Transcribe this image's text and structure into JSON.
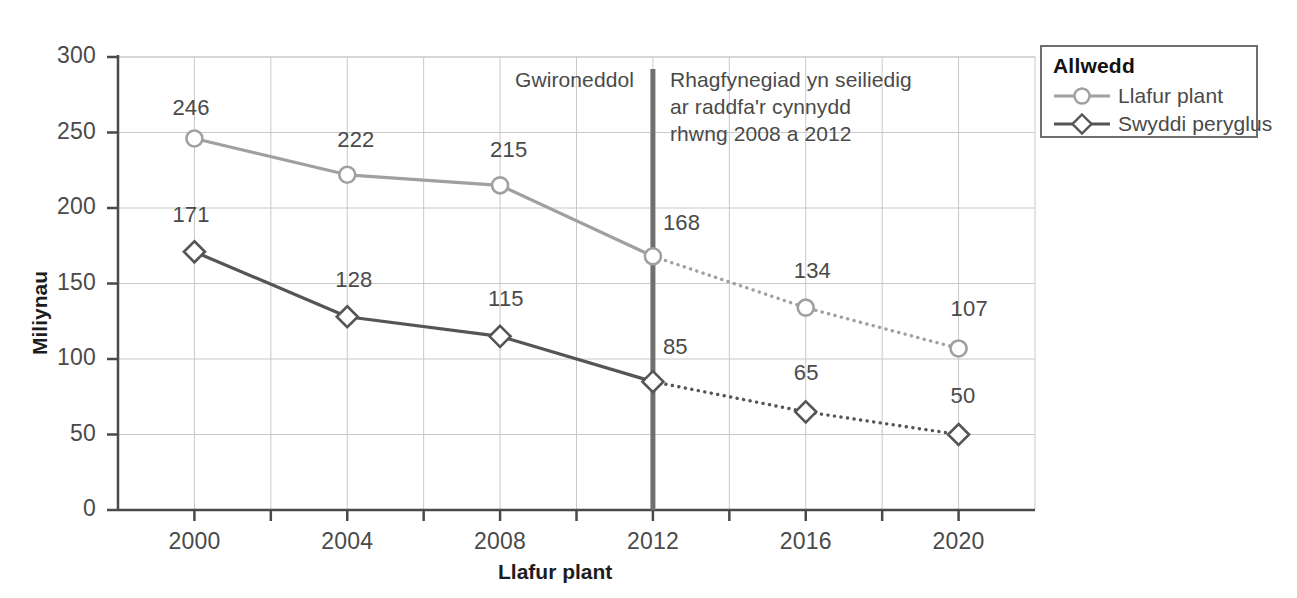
{
  "chart_data": {
    "type": "line",
    "title": "",
    "xlabel": "Llafur plant",
    "ylabel": "Miliynau",
    "x": [
      2000,
      2004,
      2008,
      2012,
      2016,
      2020
    ],
    "xticklabels": [
      "2000",
      "2004",
      "2008",
      "2012",
      "2016",
      "2020"
    ],
    "yticklabels": [
      "0",
      "50",
      "100",
      "150",
      "200",
      "250",
      "300"
    ],
    "yticks": [
      0,
      50,
      100,
      150,
      200,
      250,
      300
    ],
    "ylim": [
      0,
      300
    ],
    "xlim": [
      1998,
      2022
    ],
    "grid": true,
    "legend_position": "outside-right-top",
    "series": [
      {
        "name": "Llafur plant",
        "color": "#a0a0a0",
        "marker": "circle",
        "values": [
          246,
          222,
          215,
          168,
          134,
          107
        ],
        "labels": [
          "246",
          "222",
          "215",
          "168",
          "134",
          "107"
        ],
        "actual_through": 2012
      },
      {
        "name": "Swyddi peryglus",
        "color": "#555555",
        "marker": "diamond",
        "values": [
          171,
          128,
          115,
          85,
          65,
          50
        ],
        "labels": [
          "171",
          "128",
          "115",
          "85",
          "65",
          "50"
        ],
        "actual_through": 2012
      }
    ],
    "annotations": [
      {
        "text": "Gwironeddol",
        "x": 2012,
        "align": "right"
      },
      {
        "text": "Rhagfynegiad yn seiliedig\nar raddfa'r cynnydd\nrhwng 2008 a 2012",
        "x": 2012,
        "align": "left"
      }
    ],
    "divider": {
      "x": 2012,
      "color": "#707070"
    }
  },
  "legend": {
    "title": "Allwedd",
    "items": [
      {
        "label": "Llafur plant",
        "marker": "circle",
        "color": "#a0a0a0"
      },
      {
        "label": "Swyddi peryglus",
        "marker": "diamond",
        "color": "#555555"
      }
    ]
  },
  "axes": {
    "x_title": "Llafur plant",
    "y_title": "Miliynau"
  },
  "colors": {
    "series_light": "#a0a0a0",
    "series_dark": "#555555",
    "axis": "#4a4a4a",
    "grid": "#c9c9c9",
    "divider": "#707070",
    "text": "#4a4a4a"
  }
}
